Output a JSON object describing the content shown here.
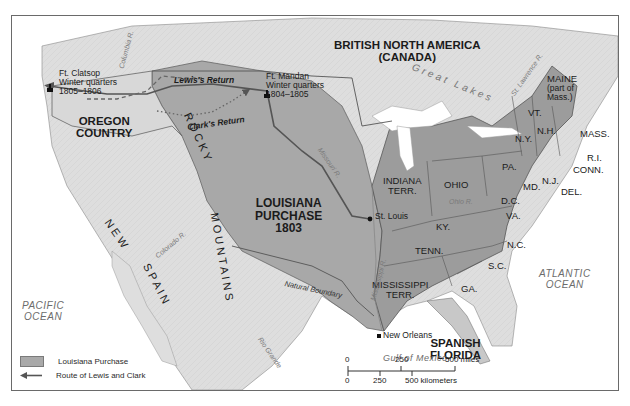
{
  "map": {
    "title": "Louisiana Purchase and the Route of Lewis and Clark",
    "colors": {
      "louisiana_purchase": "#a6a6a6",
      "us_states": "#9a9a9a",
      "foreign_land": "#dcdcdc",
      "water": "#ffffff",
      "route": "#555555"
    },
    "regions": {
      "british": "BRITISH NORTH AMERICA",
      "british_sub": "(CANADA)",
      "oregon_1": "OREGON",
      "oregon_2": "COUNTRY",
      "louisiana_1": "LOUISIANA",
      "louisiana_2": "PURCHASE",
      "louisiana_3": "1803",
      "new": "N E W",
      "spain": "S P A I N",
      "rocky": "R O C K Y",
      "mountains": "M O U N T A I N S",
      "spanish_florida_1": "SPANISH",
      "spanish_florida_2": "FLORIDA"
    },
    "states": {
      "maine": "MAINE",
      "maine_note_1": "(part of",
      "maine_note_2": "Mass.)",
      "vt": "VT.",
      "nh": "N.H.",
      "mass": "MASS.",
      "ri": "R.I.",
      "conn": "CONN.",
      "ny": "N.Y.",
      "pa": "PA.",
      "nj": "N.J.",
      "md": "MD.",
      "del": "DEL.",
      "dc": "D.C.",
      "va": "VA.",
      "nc": "N.C.",
      "sc": "S.C.",
      "ga": "GA.",
      "ohio": "OHIO",
      "ky": "KY.",
      "tenn": "TENN.",
      "indiana_1": "INDIANA",
      "indiana_2": "TERR.",
      "mississippi_1": "MISSISSIPPI",
      "mississippi_2": "TERR."
    },
    "water": {
      "pacific_1": "PACIFIC",
      "pacific_2": "OCEAN",
      "atlantic_1": "ATLANTIC",
      "atlantic_2": "OCEAN",
      "gulf": "Gulf of Mexico",
      "great_lakes": "Great Lakes"
    },
    "rivers": {
      "columbia": "Columbia R.",
      "missouri": "Missouri R.",
      "mississippi": "Mississippi R.",
      "ohio": "Ohio R.",
      "st_lawrence": "St. Lawrence R.",
      "colorado": "Colorado R.",
      "rio_grande": "Rio Grande",
      "natural_boundary": "Natural Boundary"
    },
    "places": {
      "clatsop_1": "Ft. Clatsop",
      "clatsop_2": "Winter quarters",
      "clatsop_3": "1805–1806",
      "mandan_1": "Ft. Mandan",
      "mandan_2": "Winter quarters",
      "mandan_3": "1804–1805",
      "st_louis": "St. Louis",
      "new_orleans": "New Orleans"
    },
    "routes": {
      "lewis_return": "Lewis's Return",
      "clark_return": "Clark's Return"
    },
    "legend": {
      "items": [
        {
          "label": "Louisiana Purchase",
          "symbol": "gray-swatch"
        },
        {
          "label": "Route of Lewis and Clark",
          "symbol": "arrow-left"
        }
      ]
    },
    "scale": {
      "miles_0": "0",
      "miles_250": "250",
      "miles_500": "500 miles",
      "km_0": "0",
      "km_250": "250",
      "km_500": "500 kilometers"
    }
  }
}
